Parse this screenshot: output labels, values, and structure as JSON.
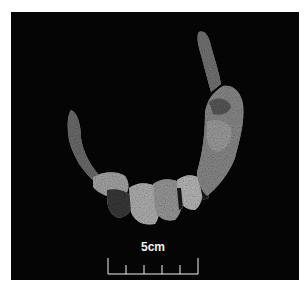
{
  "image": {
    "description": "Photograph of a crescent-shaped fragmentary artifact (jaw/dental arch) on black background",
    "background_color": "#050505",
    "page_color": "#ffffff"
  },
  "scale_bar": {
    "label": "5cm",
    "divisions": 5,
    "color": "#f2f2f2"
  }
}
